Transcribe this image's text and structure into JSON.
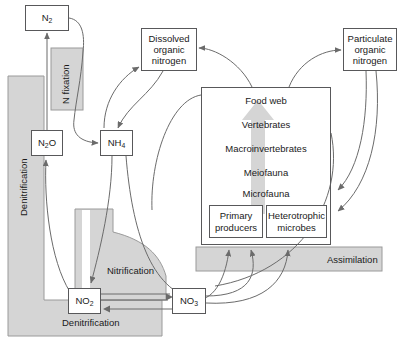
{
  "diagram": {
    "colors": {
      "gray_fill": "#d5d5d5",
      "gray_stroke": "#9a9a9a",
      "box_stroke": "#58585a",
      "arrow_stroke": "#6b6b6b",
      "text": "#1a1a1a",
      "background": "#ffffff"
    }
  },
  "pools": [
    {
      "id": "n2",
      "label": "N2",
      "base": "N",
      "sub": "2",
      "x": 25,
      "y": 5,
      "w": 44,
      "h": 26
    },
    {
      "id": "n2o",
      "label": "N2O",
      "base": "N",
      "sub": "2",
      "tail": "O",
      "x": 31,
      "y": 130,
      "w": 32,
      "h": 26
    },
    {
      "id": "nh4",
      "label": "NH4",
      "base": "NH",
      "sub": "4",
      "x": 100,
      "y": 130,
      "w": 33,
      "h": 26
    },
    {
      "id": "no2",
      "label": "NO2",
      "base": "NO",
      "sub": "2",
      "x": 68,
      "y": 288,
      "w": 33,
      "h": 26
    },
    {
      "id": "no3",
      "label": "NO3",
      "base": "NO",
      "sub": "3",
      "x": 172,
      "y": 288,
      "w": 34,
      "h": 26
    }
  ],
  "organic_pools": [
    {
      "id": "don",
      "label": "Dissolved\norganic\nnitrogen",
      "x": 141,
      "y": 28,
      "w": 56,
      "h": 43
    },
    {
      "id": "pon",
      "label": "Particulate\norganic\nnitrogen",
      "x": 343,
      "y": 28,
      "w": 54,
      "h": 43
    }
  ],
  "food_web": {
    "title": "Food web",
    "levels": [
      "Vertebrates",
      "Macroinvertebrates",
      "Meiofauna",
      "Microfauna"
    ],
    "compartments": [
      {
        "id": "primary-producers",
        "label": "Primary\nproducers",
        "x": 209,
        "y": 205,
        "w": 54,
        "h": 33
      },
      {
        "id": "heterotrophic-microbes",
        "label": "Heterotrophic\nmicrobes",
        "x": 266,
        "y": 205,
        "w": 61,
        "h": 33
      }
    ]
  },
  "processes": [
    {
      "id": "n-fixation",
      "label": "N fixation",
      "orientation": "vertical"
    },
    {
      "id": "denitrification-left",
      "label": "Denitrification",
      "orientation": "vertical"
    },
    {
      "id": "denitrification-bottom",
      "label": "Denitrification",
      "orientation": "horizontal"
    },
    {
      "id": "nitrification",
      "label": "Nitrification",
      "orientation": "horizontal"
    },
    {
      "id": "assimilation",
      "label": "Assimilation",
      "orientation": "horizontal"
    }
  ]
}
